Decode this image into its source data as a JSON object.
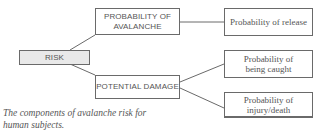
{
  "diagram": {
    "root": {
      "label": "RISK"
    },
    "level1": [
      {
        "label": "PROBABILITY OF AVALANCHE",
        "line1": "PROBABILITY OF",
        "line2": "AVALANCHE"
      },
      {
        "label": "POTENTIAL DAMAGE"
      }
    ],
    "level2": [
      {
        "parent": "PROBABILITY OF AVALANCHE",
        "label": "Probability of release"
      },
      {
        "parent": "POTENTIAL DAMAGE",
        "line1": "Probability of",
        "line2": "being caught"
      },
      {
        "parent": "POTENTIAL DAMAGE",
        "line1": "Probability of",
        "line2": "injury/death"
      }
    ],
    "caption": {
      "line1": "The components of avalanche risk for",
      "line2": "human subjects."
    }
  }
}
